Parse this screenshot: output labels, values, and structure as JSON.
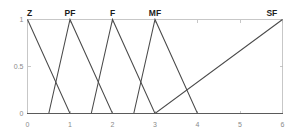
{
  "chart_data": {
    "type": "line",
    "title": "",
    "subtitle": "",
    "xlabel": "",
    "ylabel": "",
    "xlim": [
      0,
      6
    ],
    "ylim": [
      0,
      1
    ],
    "grid": false,
    "legend_position": "inline-top",
    "xticks": [
      "0",
      "1",
      "2",
      "3",
      "4",
      "5",
      "6"
    ],
    "xtick_values": [
      0,
      1,
      2,
      3,
      4,
      5,
      6
    ],
    "yticks": [
      "0",
      "0.5",
      "1"
    ],
    "ytick_values": [
      0,
      0.5,
      1
    ],
    "series": [
      {
        "name": "Z",
        "label": "Z",
        "label_x": 0.05,
        "points": [
          [
            0,
            1
          ],
          [
            1,
            0
          ],
          [
            6,
            0
          ]
        ],
        "color": "#4a4a4a"
      },
      {
        "name": "PF",
        "label": "PF",
        "label_x": 1.0,
        "points": [
          [
            0,
            0
          ],
          [
            0.5,
            0
          ],
          [
            1,
            1
          ],
          [
            2,
            0
          ],
          [
            6,
            0
          ]
        ],
        "color": "#4a4a4a"
      },
      {
        "name": "F",
        "label": "F",
        "label_x": 2.0,
        "points": [
          [
            0,
            0
          ],
          [
            1.5,
            0
          ],
          [
            2,
            1
          ],
          [
            3,
            0
          ],
          [
            6,
            0
          ]
        ],
        "color": "#4a4a4a"
      },
      {
        "name": "MF",
        "label": "MF",
        "label_x": 3.0,
        "points": [
          [
            0,
            0
          ],
          [
            2.5,
            0
          ],
          [
            3,
            1
          ],
          [
            4,
            0
          ],
          [
            6,
            0
          ]
        ],
        "color": "#4a4a4a"
      },
      {
        "name": "SF",
        "label": "SF",
        "label_x": 5.75,
        "points": [
          [
            0,
            0
          ],
          [
            3,
            0
          ],
          [
            6,
            1
          ]
        ],
        "color": "#4a4a4a"
      }
    ],
    "axis_color": "#b9b9b9",
    "baseline_color": "#5a5a5a",
    "background_color": "#ffffff"
  }
}
